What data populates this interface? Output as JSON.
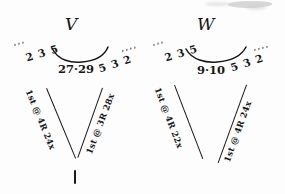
{
  "page": {
    "background_color": "#fdfdfd",
    "ink_color": "#151515"
  },
  "groups": [
    {
      "id": "v",
      "letter": "V",
      "ticks_left": "’’’",
      "numbers_left": "2 3 5",
      "numbers_center": "27·29",
      "numbers_right": "5 3 2",
      "ticks_right": "’’’’",
      "left_arm_label": "1st @ 4R 24x",
      "right_arm_label": "1st @ 3R 28x"
    },
    {
      "id": "w",
      "letter": "W",
      "ticks_left": "’’’",
      "numbers_left": "2 3 5",
      "numbers_center": "9·10",
      "numbers_right": "5 3 2",
      "ticks_right": "’’’’",
      "left_arm_label": "1st @ 4R 22x",
      "right_arm_label": "1st @ 4R 24x"
    }
  ],
  "marks": {
    "bottom_tick": "|"
  }
}
